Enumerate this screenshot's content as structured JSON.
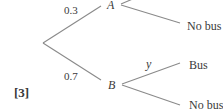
{
  "diagram": {
    "type": "probability-tree",
    "root": {
      "branches": [
        {
          "to": "A",
          "probability": "0.3"
        },
        {
          "to": "B",
          "probability": "0.7"
        }
      ]
    },
    "nodes": {
      "A": {
        "label": "A",
        "outcomes": [
          {
            "label": "No bus",
            "probability": ""
          }
        ]
      },
      "B": {
        "label": "B",
        "outcomes": [
          {
            "label": "Bus",
            "probability": "y"
          },
          {
            "label": "No bus",
            "probability": ""
          }
        ]
      }
    },
    "marks": "[3]",
    "colors": {
      "line": "#8a8a8a",
      "text": "#3a3a3a"
    }
  }
}
